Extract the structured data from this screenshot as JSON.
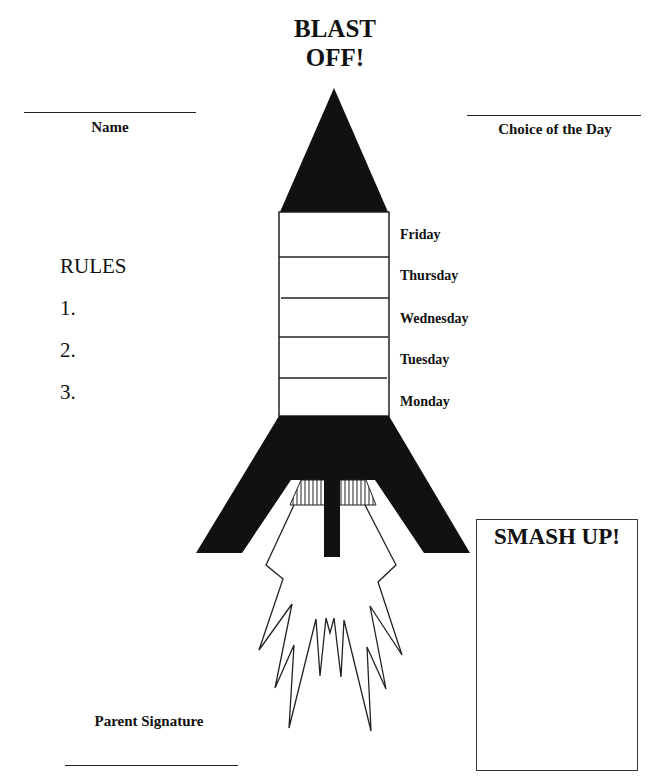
{
  "header": {
    "title_line1": "BLAST",
    "title_line2": "OFF!"
  },
  "fields": {
    "name_label": "Name",
    "choice_label": "Choice of the Day",
    "parent_signature_label": "Parent Signature"
  },
  "rules": {
    "heading": "RULES",
    "items": [
      "1.",
      "2.",
      "3."
    ]
  },
  "rocket": {
    "days": [
      "Friday",
      "Thursday",
      "Wednesday",
      "Tuesday",
      "Monday"
    ],
    "colors": {
      "fill": "#111111",
      "outline": "#222222",
      "body": "#ffffff"
    }
  },
  "smash_up": {
    "title": "SMASH UP!"
  }
}
